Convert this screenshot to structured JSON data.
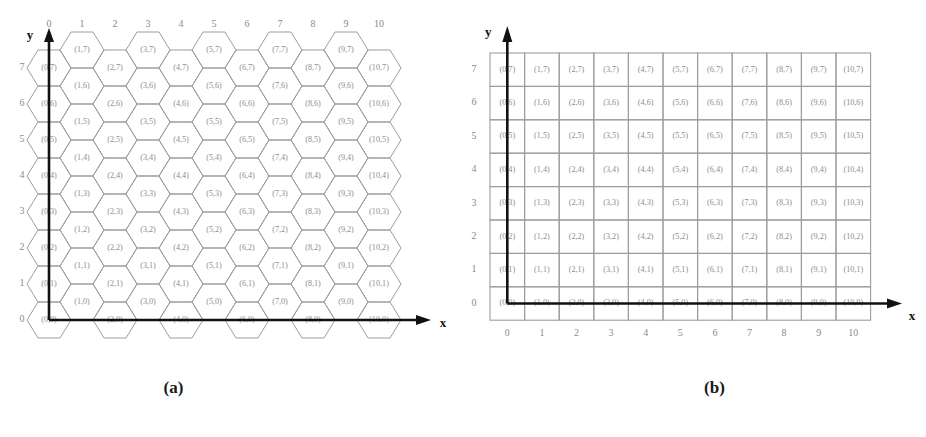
{
  "figure": {
    "panels": [
      {
        "id": "a",
        "caption": "(a)",
        "grid_type": "hexagonal",
        "axes": {
          "x_label": "x",
          "y_label": "y",
          "x_ticks": [
            "0",
            "1",
            "2",
            "3",
            "4",
            "5",
            "6",
            "7",
            "8",
            "9",
            "10"
          ],
          "y_ticks": [
            "7",
            "6",
            "5",
            "4",
            "3",
            "2",
            "1",
            "0"
          ],
          "x_tick_position": "top",
          "y_tick_position": "left"
        }
      },
      {
        "id": "b",
        "caption": "(b)",
        "grid_type": "rectangular",
        "axes": {
          "x_label": "x",
          "y_label": "y",
          "x_ticks": [
            "0",
            "1",
            "2",
            "3",
            "4",
            "5",
            "6",
            "7",
            "8",
            "9",
            "10"
          ],
          "y_ticks": [
            "7",
            "6",
            "5",
            "4",
            "3",
            "2",
            "1",
            "0"
          ],
          "x_tick_position": "bottom",
          "y_tick_position": "left"
        }
      }
    ],
    "columns": [
      0,
      1,
      2,
      3,
      4,
      5,
      6,
      7,
      8,
      9,
      10
    ],
    "rows": [
      7,
      6,
      5,
      4,
      3,
      2,
      1,
      0
    ],
    "cell_label_format": "(x,y)"
  },
  "chart_data": {
    "type": "table",
    "title": "",
    "xlabel": "x",
    "ylabel": "y",
    "xlim": [
      0,
      10
    ],
    "ylim": [
      0,
      7
    ],
    "grid": true,
    "legend": null,
    "subplots": [
      {
        "name": "(a)",
        "tessellation": "hexagonal",
        "note": "Hexagonal cell grid; odd x-columns are vertically offset by half a row.",
        "x_categories": [
          "0",
          "1",
          "2",
          "3",
          "4",
          "5",
          "6",
          "7",
          "8",
          "9",
          "10"
        ],
        "y_categories": [
          "7",
          "6",
          "5",
          "4",
          "3",
          "2",
          "1",
          "0"
        ],
        "cells": [
          [
            "(0,7)",
            "(1,7)",
            "(2,7)",
            "(3,7)",
            "(4,7)",
            "(5,7)",
            "(6,7)",
            "(7,7)",
            "(8,7)",
            "(9,7)",
            "(10,7)"
          ],
          [
            "(0,6)",
            "(1,6)",
            "(2,6)",
            "(3,6)",
            "(4,6)",
            "(5,6)",
            "(6,6)",
            "(7,6)",
            "(8,6)",
            "(9,6)",
            "(10,6)"
          ],
          [
            "(0,5)",
            "(1,5)",
            "(2,5)",
            "(3,5)",
            "(4,5)",
            "(5,5)",
            "(6,5)",
            "(7,5)",
            "(8,5)",
            "(9,5)",
            "(10,5)"
          ],
          [
            "(0,4)",
            "(1,4)",
            "(2,4)",
            "(3,4)",
            "(4,4)",
            "(5,4)",
            "(6,4)",
            "(7,4)",
            "(8,4)",
            "(9,4)",
            "(10,4)"
          ],
          [
            "(0,3)",
            "(1,3)",
            "(2,3)",
            "(3,3)",
            "(4,3)",
            "(5,3)",
            "(6,3)",
            "(7,3)",
            "(8,3)",
            "(9,3)",
            "(10,3)"
          ],
          [
            "(0,2)",
            "(1,2)",
            "(2,2)",
            "(3,2)",
            "(4,2)",
            "(5,2)",
            "(6,2)",
            "(7,2)",
            "(8,2)",
            "(9,2)",
            "(10,2)"
          ],
          [
            "(0,1)",
            "(1,1)",
            "(2,1)",
            "(3,1)",
            "(4,1)",
            "(5,1)",
            "(6,1)",
            "(7,1)",
            "(8,1)",
            "(9,1)",
            "(10,1)"
          ],
          [
            "(0,0)",
            "(1,0)",
            "(2,0)",
            "(3,0)",
            "(4,0)",
            "(5,0)",
            "(6,0)",
            "(7,0)",
            "(8,0)",
            "(9,0)",
            "(10,0)"
          ]
        ]
      },
      {
        "name": "(b)",
        "tessellation": "rectangular",
        "note": "Square cell grid; 11 columns by 8 rows.",
        "x_categories": [
          "0",
          "1",
          "2",
          "3",
          "4",
          "5",
          "6",
          "7",
          "8",
          "9",
          "10"
        ],
        "y_categories": [
          "7",
          "6",
          "5",
          "4",
          "3",
          "2",
          "1",
          "0"
        ],
        "cells": [
          [
            "(0,7)",
            "(1,7)",
            "(2,7)",
            "(3,7)",
            "(4,7)",
            "(5,7)",
            "(6,7)",
            "(7,7)",
            "(8,7)",
            "(9,7)",
            "(10,7)"
          ],
          [
            "(0,6)",
            "(1,6)",
            "(2,6)",
            "(3,6)",
            "(4,6)",
            "(5,6)",
            "(6,6)",
            "(7,6)",
            "(8,6)",
            "(9,6)",
            "(10,6)"
          ],
          [
            "(0,5)",
            "(1,5)",
            "(2,5)",
            "(3,5)",
            "(4,5)",
            "(5,5)",
            "(6,5)",
            "(7,5)",
            "(8,5)",
            "(9,5)",
            "(10,5)"
          ],
          [
            "(0,4)",
            "(1,4)",
            "(2,4)",
            "(3,4)",
            "(4,4)",
            "(5,4)",
            "(6,4)",
            "(7,4)",
            "(8,4)",
            "(9,4)",
            "(10,4)"
          ],
          [
            "(0,3)",
            "(1,3)",
            "(2,3)",
            "(3,3)",
            "(4,3)",
            "(5,3)",
            "(6,3)",
            "(7,3)",
            "(8,3)",
            "(9,3)",
            "(10,3)"
          ],
          [
            "(0,2)",
            "(1,2)",
            "(2,2)",
            "(3,2)",
            "(4,2)",
            "(5,2)",
            "(6,2)",
            "(7,2)",
            "(8,2)",
            "(9,2)",
            "(10,2)"
          ],
          [
            "(0,1)",
            "(1,1)",
            "(2,1)",
            "(3,1)",
            "(4,1)",
            "(5,1)",
            "(6,1)",
            "(7,1)",
            "(8,1)",
            "(9,1)",
            "(10,1)"
          ],
          [
            "(0,0)",
            "(1,0)",
            "(2,0)",
            "(3,0)",
            "(4,0)",
            "(5,0)",
            "(6,0)",
            "(7,0)",
            "(8,0)",
            "(9,0)",
            "(10,0)"
          ]
        ]
      }
    ]
  },
  "colors": {
    "grid_line": "#9d9d9d",
    "cell_text": "#8d8d8d",
    "tick_text": "#8a8a8a",
    "axis": "#111111",
    "background": "#ffffff"
  }
}
